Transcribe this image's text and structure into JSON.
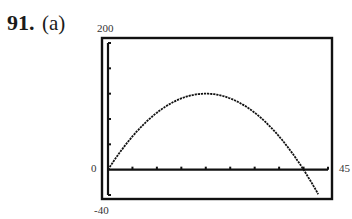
{
  "problem": {
    "number": "91.",
    "part": "(a)"
  },
  "chart_data": {
    "type": "line",
    "title": "",
    "xlabel": "",
    "ylabel": "",
    "window": {
      "xmin": 0,
      "xmax": 45,
      "ymin": -40,
      "ymax": 200
    },
    "xlim": [
      0,
      45
    ],
    "ylim": [
      -40,
      200
    ],
    "x_tick_step": 5,
    "y_tick_step": 40,
    "tick_labels": {
      "ymax": "200",
      "ymin": "-40",
      "xmin": "0",
      "xmax": "45"
    },
    "grid": false,
    "legend": null,
    "series": [
      {
        "name": "y = 12x - 0.3x^2",
        "x": [
          0,
          5,
          10,
          15,
          20,
          25,
          30,
          35,
          40,
          43
        ],
        "values": [
          0,
          52.5,
          90,
          112.5,
          120,
          112.5,
          90,
          52.5,
          0,
          -38.7
        ]
      }
    ]
  }
}
